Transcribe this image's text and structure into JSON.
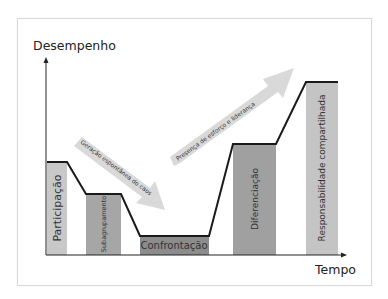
{
  "diagram": {
    "title": "",
    "y_axis_label": "Desempenho",
    "x_axis_label": "Tempo",
    "stages": [
      {
        "label": "Participação",
        "level": "medium",
        "color": "#c8c8c8"
      },
      {
        "label": "Subagrupamento",
        "level": "low-medium",
        "color": "#a6a6a6"
      },
      {
        "label": "Confrontação",
        "level": "lowest",
        "color": "#8c8c8c"
      },
      {
        "label": "Diferenciação",
        "level": "high",
        "color": "#a0a0a0"
      },
      {
        "label": "Responsabilidade compartilhada",
        "level": "highest",
        "color": "#c4c4c4"
      }
    ],
    "arrows": [
      {
        "label": "Geração espontânea do caos",
        "direction": "down"
      },
      {
        "label": "Presença de esforço e liderança",
        "direction": "up"
      }
    ],
    "colors": {
      "axis": "#222222",
      "trend_line": "#1a1a1a",
      "arrow_fill": "#d9d9d9"
    }
  }
}
